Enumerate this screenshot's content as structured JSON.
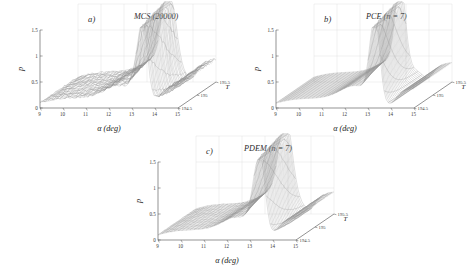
{
  "figure": {
    "background_color": "#ffffff",
    "mesh_color": "#8e8e8e",
    "axis_color": "#4a4a4a",
    "grid_color": "#d8d8d8"
  },
  "panels": [
    {
      "id": "a",
      "tag": "a)",
      "title": "MCS (20000)",
      "position": "top-left"
    },
    {
      "id": "b",
      "tag": "b)",
      "title": "PCE (n = 7)",
      "position": "top-right"
    },
    {
      "id": "c",
      "tag": "c)",
      "title": "PDEM (n = 7)",
      "position": "bottom-center"
    }
  ],
  "axes": {
    "x": {
      "label": "α (deg)",
      "ticks": [
        "9",
        "10",
        "11",
        "12",
        "13",
        "14",
        "15"
      ],
      "range": [
        9,
        15
      ]
    },
    "y": {
      "label": "T",
      "ticks": [
        "194.5",
        "195",
        "195.5"
      ],
      "range": [
        194.5,
        195.5
      ]
    },
    "z": {
      "label": "p",
      "ticks": [
        "0",
        "0.5",
        "1",
        "1.5"
      ],
      "range": [
        0,
        1.5
      ]
    }
  },
  "chart_data": {
    "type": "line",
    "xlabel": "α (deg)",
    "ylabel": "T",
    "zlabel": "p",
    "xlim": [
      9,
      15
    ],
    "ylim": [
      194.5,
      195.5
    ],
    "zlim": [
      0,
      1.5
    ],
    "grid": true,
    "legend": "none",
    "plot_kind": "3d-mesh-surface",
    "x": [
      9,
      9.5,
      10,
      10.5,
      11,
      11.5,
      12,
      12.5,
      13,
      13.5,
      14,
      14.5,
      15
    ],
    "y": [
      194.5,
      194.7,
      194.9,
      195.1,
      195.3,
      195.5
    ],
    "series": [
      {
        "name": "a) MCS (20000)",
        "z_profile_mid": [
          0.18,
          0.19,
          0.2,
          0.22,
          0.26,
          0.34,
          0.5,
          0.62,
          1.05,
          1.52,
          0.55,
          0.38,
          0.3
        ],
        "peak_x": 13.5,
        "peak_z": 1.52,
        "plateau_z": 0.2,
        "notes": "noisy sampled mesh, sharp ridge near alpha=13.5, valley gap near 13.8"
      },
      {
        "name": "b) PCE (n = 7)",
        "z_profile_mid": [
          0.17,
          0.18,
          0.19,
          0.21,
          0.25,
          0.33,
          0.46,
          0.66,
          1.2,
          1.55,
          0.42,
          0.33,
          0.28
        ],
        "peak_x": 13.3,
        "peak_z": 1.55,
        "plateau_z": 0.19,
        "notes": "smooth narrow peak, slightly sharper than MCS"
      },
      {
        "name": "c) PDEM (n = 7)",
        "z_profile_mid": [
          0.18,
          0.19,
          0.2,
          0.22,
          0.26,
          0.35,
          0.5,
          0.63,
          1.08,
          1.5,
          0.52,
          0.37,
          0.3
        ],
        "peak_x": 13.45,
        "peak_z": 1.5,
        "plateau_z": 0.2,
        "notes": "closely matches MCS reference surface"
      }
    ]
  }
}
